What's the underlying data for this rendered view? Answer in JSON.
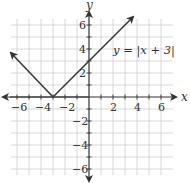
{
  "chart_data": {
    "type": "line",
    "title": "",
    "xlabel": "x",
    "ylabel": "y",
    "xlim": [
      -6.5,
      6.5
    ],
    "ylim": [
      -6.5,
      6.5
    ],
    "grid": true,
    "grid_step": 1,
    "x_ticks": [
      -6,
      -4,
      -2,
      2,
      4,
      6
    ],
    "y_ticks": [
      -6,
      -4,
      -2,
      2,
      4,
      6
    ],
    "x_tick_labels": [
      "−6",
      "−4",
      "−2",
      "2",
      "4",
      "6"
    ],
    "y_tick_labels": [
      "−6",
      "−4",
      "−2",
      "2",
      "4",
      "6"
    ],
    "series": [
      {
        "name": "y = |x + 3|",
        "function": "abs(x + 3)",
        "points": [
          [
            -6.8,
            3.8
          ],
          [
            -3,
            0
          ],
          [
            3.6,
            6.6
          ]
        ],
        "arrows_at_ends": true,
        "color": "#3a3a3a"
      }
    ],
    "annotations": [
      {
        "text": "y = |x + 3|",
        "x": 1.9,
        "y": 3.6
      }
    ],
    "vertex": [
      -3,
      0
    ]
  },
  "labels": {
    "x_axis": "x",
    "y_axis": "y",
    "function": "y = |x + 3|",
    "x_ticks": [
      "−6",
      "−4",
      "−2",
      "2",
      "4",
      "6"
    ],
    "y_ticks_pos": [
      "2",
      "4",
      "6"
    ],
    "y_ticks_neg": [
      "−2",
      "−4",
      "−6"
    ]
  },
  "colors": {
    "grid": "#cfcfcf",
    "axis": "#333333",
    "line": "#3a3a3a"
  }
}
